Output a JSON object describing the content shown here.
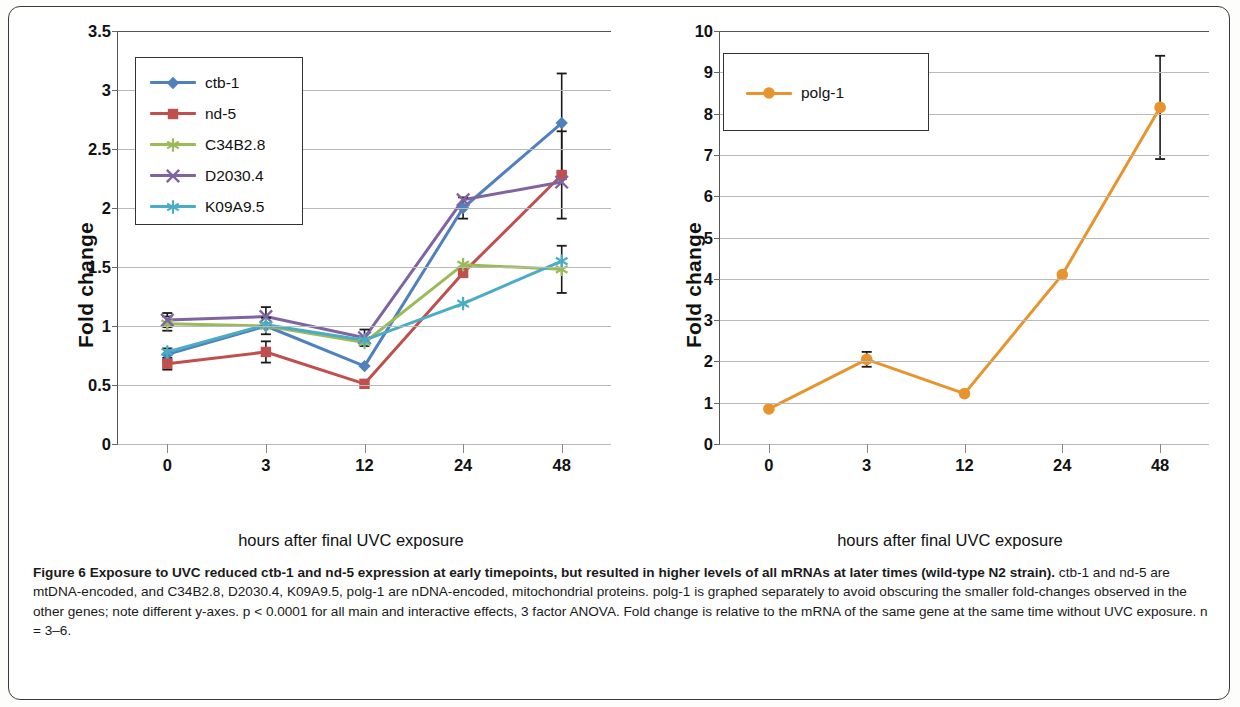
{
  "figure": {
    "label": "Figure 6",
    "caption_bold": "Exposure to UVC reduced ctb-1 and nd-5 expression at early timepoints, but resulted in higher levels of all mRNAs at later times (wild-type N2 strain).",
    "caption_rest": "ctb-1 and nd-5 are mtDNA-encoded, and C34B2.8, D2030.4, K09A9.5, polg-1 are nDNA-encoded, mitochondrial proteins. polg-1 is graphed separately to avoid obscuring the smaller fold-changes observed in the other genes; note different y-axes. p < 0.0001 for all main and interactive effects, 3 factor ANOVA. Fold change is relative to the mRNA of the same gene at the same time without UVC exposure. n = 3–6."
  },
  "chart_data": [
    {
      "type": "line",
      "title": "",
      "xlabel": "hours after final UVC exposure",
      "ylabel": "Fold change",
      "categories": [
        "0",
        "3",
        "12",
        "24",
        "48"
      ],
      "ylim": [
        0,
        3.5
      ],
      "yticks": [
        "0",
        "0.5",
        "1",
        "1.5",
        "2",
        "2.5",
        "3",
        "3.5"
      ],
      "grid": true,
      "legend_position": "top-left",
      "series": [
        {
          "name": "ctb-1",
          "color": "#4f81bd",
          "marker": "diamond",
          "values": [
            0.76,
            1.0,
            0.66,
            2.0,
            2.72
          ],
          "errors": [
            0.05,
            0.07,
            0.0,
            0.09,
            0.42
          ]
        },
        {
          "name": "nd-5",
          "color": "#c0504d",
          "marker": "square",
          "values": [
            0.68,
            0.78,
            0.51,
            1.45,
            2.28
          ],
          "errors": [
            0.05,
            0.09,
            0.0,
            0.0,
            0.37
          ]
        },
        {
          "name": "C34B2.8",
          "color": "#9bbb59",
          "marker": "star",
          "values": [
            1.02,
            1.0,
            0.86,
            1.52,
            1.48
          ],
          "errors": [
            0.06,
            0.0,
            0.0,
            0.0,
            0.2
          ]
        },
        {
          "name": "D2030.4",
          "color": "#8064a2",
          "marker": "x",
          "values": [
            1.05,
            1.08,
            0.9,
            2.07,
            2.22
          ],
          "errors": [
            0.06,
            0.08,
            0.07,
            0.0,
            0.0
          ]
        },
        {
          "name": "K09A9.5",
          "color": "#4bacc6",
          "marker": "asterisk",
          "values": [
            0.78,
            1.01,
            0.88,
            1.19,
            1.55
          ],
          "errors": [
            0.0,
            0.0,
            0.0,
            0.0,
            0.0
          ]
        }
      ]
    },
    {
      "type": "line",
      "title": "",
      "xlabel": "hours after final UVC exposure",
      "ylabel": "Fold change",
      "categories": [
        "0",
        "3",
        "12",
        "24",
        "48"
      ],
      "ylim": [
        0,
        10
      ],
      "yticks": [
        "0",
        "1",
        "2",
        "3",
        "4",
        "5",
        "6",
        "7",
        "8",
        "9",
        "10"
      ],
      "grid": true,
      "legend_position": "top-left",
      "series": [
        {
          "name": "polg-1",
          "color": "#e8942e",
          "marker": "circle",
          "values": [
            0.85,
            2.05,
            1.22,
            4.1,
            8.15
          ],
          "errors": [
            0.0,
            0.18,
            0.0,
            0.0,
            1.25
          ]
        }
      ]
    }
  ]
}
